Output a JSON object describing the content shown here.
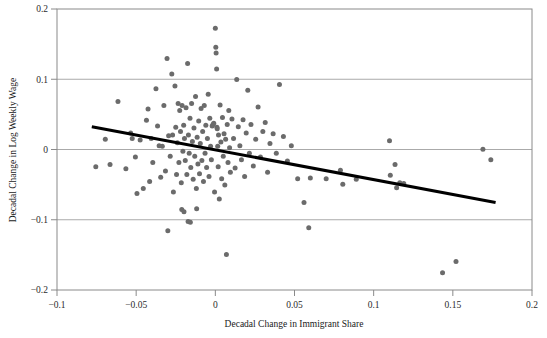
{
  "chart_data": {
    "type": "scatter",
    "title": "",
    "xlabel": "Decadal Change in Immigrant Share",
    "ylabel": "Decadal Change in Log Weekly Wage",
    "xlim": [
      -0.1,
      0.2
    ],
    "ylim": [
      -0.2,
      0.2
    ],
    "xticks": [
      -0.1,
      -0.05,
      0,
      0.05,
      0.1,
      0.15,
      0.2
    ],
    "xticklabels": [
      "-0.1",
      "-0.05",
      "0",
      "0.05",
      "0.1",
      "0.15",
      "0.2"
    ],
    "yticks": [
      -0.2,
      -0.1,
      0,
      0.1,
      0.2
    ],
    "yticklabels": [
      "-0.2",
      "-0.1",
      "0",
      "0.1",
      "0.2"
    ],
    "grid": "horizontal",
    "legend": "none",
    "marker_color": "#6b6b6b",
    "marker_size": 5,
    "frame_color": "#8a8a8a",
    "gridline_color": "#aaaaaa",
    "trendline": {
      "type": "linear-fit",
      "color": "#000000",
      "width": 3,
      "x_start": -0.078,
      "y_start": 0.0325,
      "x_end": 0.177,
      "y_end": -0.0755,
      "slope": -0.425,
      "intercept": -0.0006
    },
    "points": [
      [
        -0.0755,
        -0.0245
      ],
      [
        -0.0695,
        0.0145
      ],
      [
        -0.0665,
        -0.0215
      ],
      [
        -0.0615,
        0.0685
      ],
      [
        -0.0565,
        -0.0275
      ],
      [
        -0.0535,
        0.0235
      ],
      [
        -0.0525,
        0.0155
      ],
      [
        -0.0505,
        -0.0105
      ],
      [
        -0.0495,
        -0.0625
      ],
      [
        -0.0475,
        0.0135
      ],
      [
        -0.0455,
        -0.0555
      ],
      [
        -0.0435,
        0.0415
      ],
      [
        -0.0425,
        0.0575
      ],
      [
        -0.0415,
        -0.0455
      ],
      [
        -0.0405,
        0.0155
      ],
      [
        -0.0395,
        -0.0185
      ],
      [
        -0.0375,
        0.0865
      ],
      [
        -0.0365,
        0.0335
      ],
      [
        -0.0355,
        0.0055
      ],
      [
        -0.0345,
        -0.0395
      ],
      [
        -0.0335,
        0.0045
      ],
      [
        -0.0325,
        0.0625
      ],
      [
        -0.0315,
        -0.0305
      ],
      [
        -0.0305,
        0.1295
      ],
      [
        -0.03,
        -0.1155
      ],
      [
        -0.0295,
        0.0195
      ],
      [
        -0.0285,
        -0.0095
      ],
      [
        -0.0275,
        0.1075
      ],
      [
        -0.027,
        0.0205
      ],
      [
        -0.0265,
        -0.0605
      ],
      [
        -0.0255,
        0.0905
      ],
      [
        -0.025,
        0.0315
      ],
      [
        -0.0245,
        -0.0355
      ],
      [
        -0.024,
        0.0095
      ],
      [
        -0.0235,
        0.0655
      ],
      [
        -0.023,
        -0.0185
      ],
      [
        -0.0225,
        0.0555
      ],
      [
        -0.022,
        0.0255
      ],
      [
        -0.0215,
        -0.0475
      ],
      [
        -0.0212,
        -0.0855
      ],
      [
        -0.021,
        0.0625
      ],
      [
        -0.0205,
        -0.0025
      ],
      [
        -0.02,
        0.0345
      ],
      [
        -0.0198,
        -0.0885
      ],
      [
        -0.0195,
        0.0155
      ],
      [
        -0.019,
        -0.0155
      ],
      [
        -0.0185,
        0.0595
      ],
      [
        -0.018,
        -0.0355
      ],
      [
        -0.0175,
        0.1225
      ],
      [
        -0.0172,
        -0.1025
      ],
      [
        -0.017,
        0.0205
      ],
      [
        -0.0165,
        -0.0055
      ],
      [
        -0.016,
        0.0445
      ],
      [
        -0.0158,
        -0.1035
      ],
      [
        -0.0155,
        -0.0255
      ],
      [
        -0.015,
        0.0655
      ],
      [
        -0.0145,
        0.0115
      ],
      [
        -0.014,
        -0.0425
      ],
      [
        -0.0135,
        0.0305
      ],
      [
        -0.013,
        -0.0095
      ],
      [
        -0.0125,
        0.0755
      ],
      [
        -0.012,
        -0.0555
      ],
      [
        -0.0118,
        -0.0845
      ],
      [
        -0.0115,
        0.0175
      ],
      [
        -0.011,
        -0.0205
      ],
      [
        -0.0105,
        0.0405
      ],
      [
        -0.01,
        -0.0345
      ],
      [
        -0.0095,
        0.0085
      ],
      [
        -0.009,
        0.0585
      ],
      [
        -0.0085,
        -0.0155
      ],
      [
        -0.008,
        0.0255
      ],
      [
        -0.0075,
        -0.0455
      ],
      [
        -0.007,
        0.0625
      ],
      [
        -0.0065,
        -0.0055
      ],
      [
        -0.006,
        0.0345
      ],
      [
        -0.0055,
        -0.0255
      ],
      [
        -0.005,
        0.0155
      ],
      [
        -0.0045,
        0.0785
      ],
      [
        -0.004,
        -0.0385
      ],
      [
        -0.0035,
        0.0445
      ],
      [
        -0.003,
        0.0045
      ],
      [
        -0.0025,
        -0.0145
      ],
      [
        -0.002,
        0.0335
      ],
      [
        -0.0015,
        0.0355
      ],
      [
        -0.001,
        0.0375
      ],
      [
        -0.0005,
        -0.0605
      ],
      [
        0.0,
        0.1725
      ],
      [
        0.0003,
        0.1455
      ],
      [
        0.0005,
        0.1375
      ],
      [
        0.0008,
        0.1145
      ],
      [
        0.001,
        0.0315
      ],
      [
        0.0012,
        0.0295
      ],
      [
        0.0015,
        0.0045
      ],
      [
        0.0018,
        -0.0245
      ],
      [
        0.002,
        0.0205
      ],
      [
        0.0025,
        -0.0705
      ],
      [
        0.003,
        0.0635
      ],
      [
        0.0035,
        0.0105
      ],
      [
        0.004,
        -0.0415
      ],
      [
        0.0045,
        0.0455
      ],
      [
        0.005,
        -0.0095
      ],
      [
        0.0055,
        0.0225
      ],
      [
        0.006,
        -0.0505
      ],
      [
        0.0065,
        0.0145
      ],
      [
        0.007,
        -0.1495
      ],
      [
        0.0075,
        0.0355
      ],
      [
        0.008,
        -0.0185
      ],
      [
        0.0085,
        0.0555
      ],
      [
        0.009,
        0.0025
      ],
      [
        0.0095,
        -0.0325
      ],
      [
        0.0105,
        0.0435
      ],
      [
        0.0115,
        0.0155
      ],
      [
        0.0125,
        -0.0265
      ],
      [
        0.0135,
        0.0995
      ],
      [
        0.0145,
        0.0325
      ],
      [
        0.0155,
        0.0055
      ],
      [
        0.0165,
        -0.0145
      ],
      [
        0.0175,
        0.0425
      ],
      [
        0.0185,
        -0.0385
      ],
      [
        0.0195,
        0.0235
      ],
      [
        0.0205,
        0.0845
      ],
      [
        0.0215,
        -0.0055
      ],
      [
        0.0225,
        0.0355
      ],
      [
        0.024,
        -0.0235
      ],
      [
        0.0255,
        0.0145
      ],
      [
        0.027,
        0.0605
      ],
      [
        0.0285,
        -0.0105
      ],
      [
        0.03,
        0.0255
      ],
      [
        0.0315,
        0.0385
      ],
      [
        0.033,
        -0.0325
      ],
      [
        0.0345,
        0.0085
      ],
      [
        0.0365,
        0.0225
      ],
      [
        0.0385,
        -0.0055
      ],
      [
        0.0405,
        0.0925
      ],
      [
        0.043,
        0.0185
      ],
      [
        0.0455,
        -0.0165
      ],
      [
        0.048,
        0.0055
      ],
      [
        0.052,
        -0.0415
      ],
      [
        0.056,
        -0.0755
      ],
      [
        0.059,
        -0.1115
      ],
      [
        0.06,
        -0.0405
      ],
      [
        0.07,
        -0.0415
      ],
      [
        0.079,
        -0.0295
      ],
      [
        0.0805,
        -0.0495
      ],
      [
        0.089,
        -0.0425
      ],
      [
        0.11,
        0.0125
      ],
      [
        0.1105,
        -0.0365
      ],
      [
        0.1135,
        -0.0215
      ],
      [
        0.1145,
        -0.0545
      ],
      [
        0.1165,
        -0.0475
      ],
      [
        0.119,
        -0.0485
      ],
      [
        0.1435,
        -0.1755
      ],
      [
        0.152,
        -0.1595
      ],
      [
        0.169,
        0.0005
      ],
      [
        0.174,
        -0.0145
      ]
    ]
  }
}
